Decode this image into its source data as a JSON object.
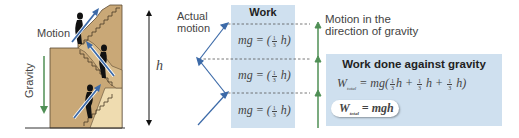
{
  "left_figure": {
    "motion_label": "Motion",
    "gravity_label": "Gravity",
    "height_label": "h",
    "colors": {
      "stair_dark": "#c9a877",
      "stair_light": "#efdcb0",
      "gravity_arrow": "#4f8f55",
      "motion_arrow": "#3c6aa8"
    }
  },
  "middle": {
    "actual_motion_label": "Actual motion",
    "actual_motion_line1": "Actual",
    "actual_motion_line2": "motion",
    "work_title": "Work",
    "work_rows": [
      {
        "lhs": "mg = (",
        "frac_num": "1",
        "frac_den": "3",
        "rhs": " h)"
      },
      {
        "lhs": "mg = (",
        "frac_num": "1",
        "frac_den": "3",
        "rhs": " h)"
      },
      {
        "lhs": "mg = (",
        "frac_num": "1",
        "frac_den": "3",
        "rhs": " h)"
      }
    ]
  },
  "right": {
    "gravity_motion_line1": "Motion in the",
    "gravity_motion_line2": "direction of gravity",
    "box_title": "Work done against gravity",
    "eq1": {
      "W": "W",
      "sub": "total",
      "p1": " = mg(",
      "frac_num": "1",
      "frac_den": "3",
      "t1": "h + ",
      "t2": " h + ",
      "t3": " h)"
    },
    "eq2": {
      "W": "W",
      "sub": "total",
      "rhs": " = mgh"
    },
    "colors": {
      "box_bg": "#cfe0ef",
      "arrow": "#4f8f55"
    }
  }
}
